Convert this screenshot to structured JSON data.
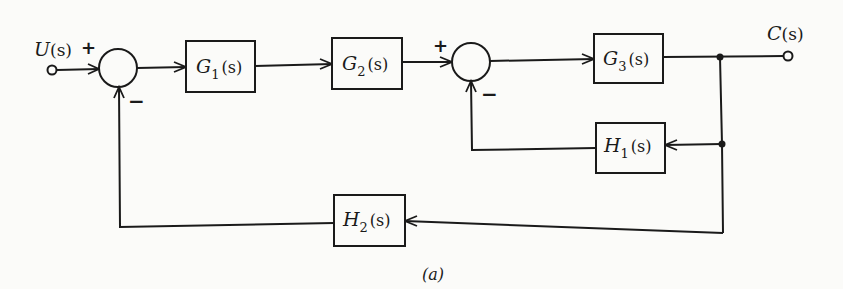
{
  "diagram": {
    "caption": "(a)",
    "input": {
      "label_main": "U",
      "label_arg": "(s)"
    },
    "output": {
      "label_main": "C",
      "label_arg": "(s)"
    },
    "summing_junctions": [
      {
        "id": "sum1",
        "plus_sign": "+",
        "minus_sign": "−"
      },
      {
        "id": "sum2",
        "plus_sign": "+",
        "minus_sign": "−"
      }
    ],
    "blocks": [
      {
        "id": "G1",
        "main": "G",
        "sub": "1",
        "arg": "(s)"
      },
      {
        "id": "G2",
        "main": "G",
        "sub": "2",
        "arg": "(s)"
      },
      {
        "id": "G3",
        "main": "G",
        "sub": "3",
        "arg": "(s)"
      },
      {
        "id": "H1",
        "main": "H",
        "sub": "1",
        "arg": "(s)"
      },
      {
        "id": "H2",
        "main": "H",
        "sub": "2",
        "arg": "(s)"
      }
    ],
    "connections": [
      "U(s) -> sum1 (+)",
      "sum1 -> G1",
      "G1 -> G2",
      "G2 -> sum2 (+)",
      "sum2 -> G3",
      "G3 -> C(s)",
      "C(s) -> H1 -> sum2 (-)",
      "C(s) -> H2 -> sum1 (-)"
    ]
  }
}
